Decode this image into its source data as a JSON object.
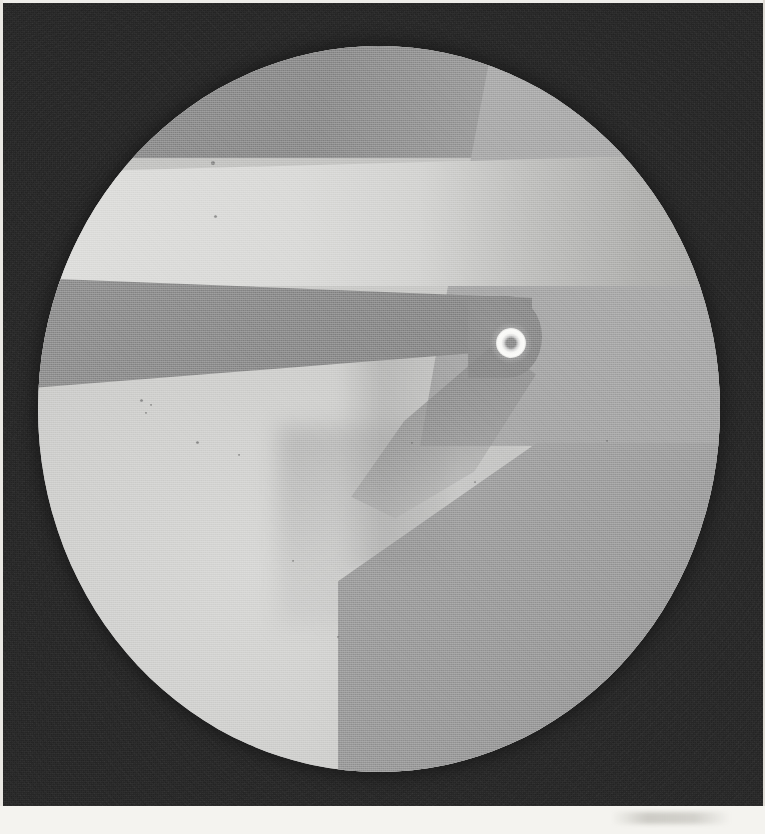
{
  "figure": {
    "kind": "halftone-photographic-plate",
    "description": "Circular illuminated field of view containing a tapered blade-like probe whose rounded tip carries a bright annular aperture",
    "plate_width_px": 765,
    "plate_height_px": 834,
    "background_label": "dark grainy halftone surround",
    "margin_label": "pale paper margin"
  },
  "field_of_view": {
    "label": "circular field of view",
    "center_x_px": 379,
    "center_y_px": 409,
    "radius_x_px": 341,
    "radius_y_px": 363,
    "top_px": 46,
    "left_px": 38
  },
  "regions": [
    {
      "name": "upper-grey-zone",
      "label": "upper medium-grey zone",
      "color": "#8c8c8c",
      "top_px": 46,
      "bottom_px": 158
    },
    {
      "name": "upper-right-grey-zone",
      "label": "upper-right lighter grey flank",
      "color": "#a8a8a8",
      "top_px": 46,
      "bottom_px": 443
    },
    {
      "name": "bright-band",
      "label": "bright illuminated band",
      "color": "#d9d9d7",
      "top_px": 155,
      "bottom_px": 285
    },
    {
      "name": "blade",
      "label": "tapered dark blade",
      "color": "#8d8d8d",
      "top_px": 278,
      "bottom_px": 345
    },
    {
      "name": "lower-left-bright-zone",
      "label": "lower-left bright field",
      "color": "#cfcfcf",
      "top_px": 345,
      "bottom_px": 772
    },
    {
      "name": "lower-right-grey-zone",
      "label": "lower-right medium grey quadrant",
      "color": "#9a9a9a",
      "top_px": 443,
      "bottom_px": 772
    }
  ],
  "aperture": {
    "label": "bright annular aperture at blade tip",
    "center_x_px": 473,
    "center_y_px": 297,
    "outer_diameter_px": 30,
    "ring_color": "#f8f8f6",
    "core_color": "#8d8d8d"
  },
  "specks": [
    {
      "x_px": 211,
      "y_px": 161,
      "size_px": 4
    },
    {
      "x_px": 214,
      "y_px": 215,
      "size_px": 3
    },
    {
      "x_px": 140,
      "y_px": 399,
      "size_px": 3
    },
    {
      "x_px": 150,
      "y_px": 404,
      "size_px": 2
    },
    {
      "x_px": 145,
      "y_px": 412,
      "size_px": 2
    },
    {
      "x_px": 196,
      "y_px": 441,
      "size_px": 3
    },
    {
      "x_px": 238,
      "y_px": 454,
      "size_px": 2
    },
    {
      "x_px": 411,
      "y_px": 442,
      "size_px": 2
    },
    {
      "x_px": 292,
      "y_px": 560,
      "size_px": 2
    },
    {
      "x_px": 337,
      "y_px": 636,
      "size_px": 2
    },
    {
      "x_px": 474,
      "y_px": 481,
      "size_px": 2
    },
    {
      "x_px": 606,
      "y_px": 440,
      "size_px": 2
    }
  ],
  "palette": {
    "surround": "#2b2b2b",
    "paper": "#f4f3ef",
    "bright": "#d9d9d7",
    "mid_grey": "#9a9a9a",
    "dark_grey": "#8c8c8c",
    "highlight": "#fbfbf9"
  }
}
